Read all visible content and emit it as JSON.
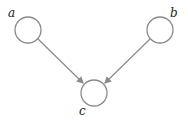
{
  "diagram": {
    "type": "directed-graph",
    "nodes": [
      {
        "id": "a",
        "label": "a"
      },
      {
        "id": "b",
        "label": "b"
      },
      {
        "id": "c",
        "label": "c"
      }
    ],
    "edges": [
      {
        "from": "a",
        "to": "c"
      },
      {
        "from": "b",
        "to": "c"
      }
    ],
    "colors": {
      "stroke": "#8a8a8a",
      "text": "#222222"
    }
  }
}
